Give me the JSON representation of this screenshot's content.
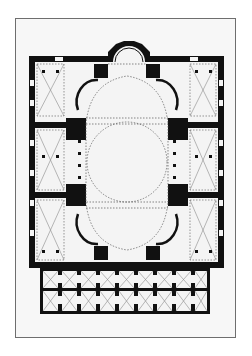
{
  "figure": {
    "colors": {
      "page_bg": "#ffffff",
      "sheet_bg": "#f7f7f7",
      "frame": "#6e6e6e",
      "wall": "#111111",
      "floor": "#f4f4f4",
      "dotted": "#555555",
      "vault_lines": "#8a8a8a"
    },
    "narthex": {
      "inner_bays": 9,
      "outer_bays": 9
    },
    "aisle_bays_per_side": 3
  }
}
